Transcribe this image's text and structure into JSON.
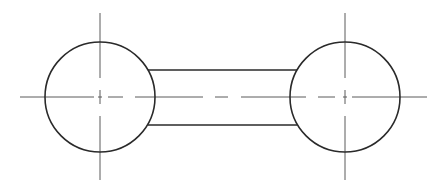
{
  "diagram": {
    "type": "technical-drawing",
    "colors": {
      "background": "#ffffff",
      "outline": "#2a2a2a",
      "centerline": "#5a5a5a"
    },
    "shapes": {
      "left_circle": {
        "cx": 100,
        "cy": 97,
        "r": 55
      },
      "right_circle": {
        "cx": 345,
        "cy": 97,
        "r": 55
      },
      "bar": {
        "x1": 148,
        "x2": 297,
        "y_top": 70,
        "y_bottom": 125
      }
    },
    "centerlines": {
      "horizontal": {
        "x1": 20,
        "x2": 427,
        "y": 97
      },
      "left_vertical": {
        "x": 100,
        "y1": 13,
        "y2": 180
      },
      "right_vertical": {
        "x": 345,
        "y1": 13,
        "y2": 180
      }
    },
    "labels": []
  }
}
